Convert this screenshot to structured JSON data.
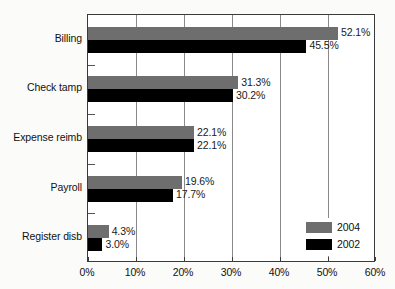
{
  "chart_data": {
    "type": "bar",
    "orientation": "horizontal",
    "title": "",
    "subtitle": "",
    "xlabel": "",
    "ylabel": "",
    "xlim": [
      0,
      60
    ],
    "xtick_labels": [
      "0%",
      "10%",
      "20%",
      "30%",
      "40%",
      "50%",
      "60%"
    ],
    "xticks": [
      0,
      10,
      20,
      30,
      40,
      50,
      60
    ],
    "grid": true,
    "grid_axis": "x",
    "legend_position": "bottom-right",
    "categories": [
      "Billing",
      "Check tamp",
      "Expense reimb",
      "Payroll",
      "Register disb"
    ],
    "series": [
      {
        "name": "2004",
        "color": "#6e6e6e",
        "values": [
          52.1,
          31.3,
          22.1,
          19.6,
          4.3
        ],
        "value_labels": [
          "52.1%",
          "31.3%",
          "22.1%",
          "19.6%",
          "4.3%"
        ]
      },
      {
        "name": "2002",
        "color": "#000000",
        "values": [
          45.5,
          30.2,
          22.1,
          17.7,
          3.0
        ],
        "value_labels": [
          "45.5%",
          "30.2%",
          "22.1%",
          "17.7%",
          "3.0%"
        ]
      }
    ]
  },
  "legend": {
    "items": [
      {
        "label": "2004",
        "color": "#6e6e6e"
      },
      {
        "label": "2002",
        "color": "#000000"
      }
    ]
  },
  "colors": {
    "series_2004": "#6e6e6e",
    "series_2002": "#000000",
    "axis": "#3a3a3a",
    "gridline": "#8a8a8a",
    "background": "#ffffff"
  }
}
